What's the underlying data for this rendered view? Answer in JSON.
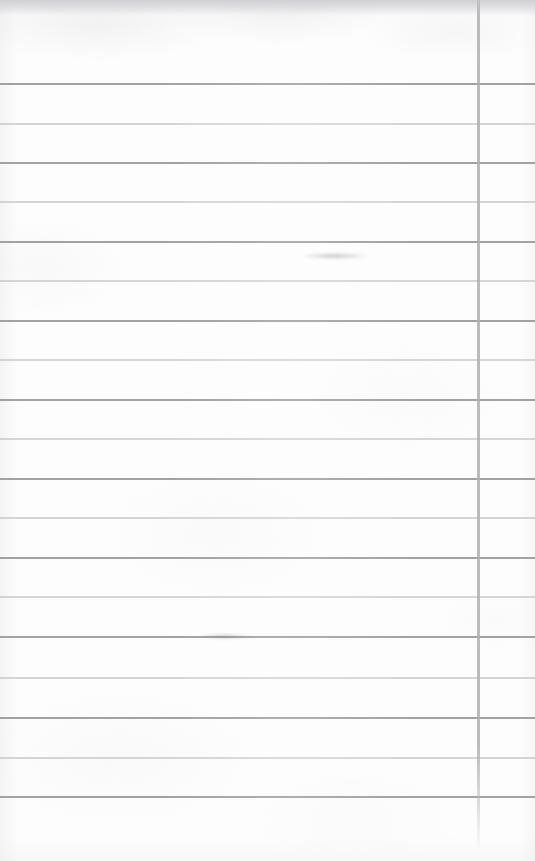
{
  "document": {
    "kind": "scanned-blank-lined-page",
    "title": "Blank ruled notebook page",
    "page_width": 535,
    "page_height": 861,
    "has_text_content": false,
    "visible_text": ""
  },
  "paper": {
    "background_color": "#fdfdfd",
    "edge_shadow_color": "#e4e4e6",
    "texture": "subtle mottled scan grain, darker band along top edge"
  },
  "ruling": {
    "horizontal_line_color_dark": "#9a9a9e",
    "horizontal_line_color_light": "#c6c6ca",
    "vertical_line_color": "#b0b0b4",
    "line_spacing_px": 39.3,
    "first_line_y": 84,
    "line_count": 19,
    "top_margin_px": 84,
    "bottom_blank_px": 64,
    "horizontal_lines": [
      {
        "y": 84,
        "thickness": 2.0,
        "tone": "dark"
      },
      {
        "y": 124,
        "thickness": 1.4,
        "tone": "light"
      },
      {
        "y": 163,
        "thickness": 1.8,
        "tone": "dark"
      },
      {
        "y": 202,
        "thickness": 1.4,
        "tone": "light"
      },
      {
        "y": 242,
        "thickness": 1.8,
        "tone": "dark"
      },
      {
        "y": 281,
        "thickness": 1.4,
        "tone": "light"
      },
      {
        "y": 321,
        "thickness": 2.0,
        "tone": "dark"
      },
      {
        "y": 360,
        "thickness": 1.3,
        "tone": "light"
      },
      {
        "y": 400,
        "thickness": 1.8,
        "tone": "dark"
      },
      {
        "y": 439,
        "thickness": 1.4,
        "tone": "light"
      },
      {
        "y": 479,
        "thickness": 2.0,
        "tone": "dark"
      },
      {
        "y": 518,
        "thickness": 1.4,
        "tone": "light"
      },
      {
        "y": 558,
        "thickness": 1.8,
        "tone": "dark"
      },
      {
        "y": 597,
        "thickness": 1.4,
        "tone": "light"
      },
      {
        "y": 637,
        "thickness": 1.9,
        "tone": "dark"
      },
      {
        "y": 678,
        "thickness": 1.4,
        "tone": "light"
      },
      {
        "y": 718,
        "thickness": 1.9,
        "tone": "dark"
      },
      {
        "y": 758,
        "thickness": 1.4,
        "tone": "light"
      },
      {
        "y": 797,
        "thickness": 1.9,
        "tone": "dark"
      }
    ],
    "vertical_lines": [
      {
        "x": 477,
        "width": 3,
        "top": 0,
        "bottom": 848,
        "tone": "margin-rule"
      }
    ]
  },
  "artifacts": [
    {
      "name": "top-edge-scan-shadow",
      "x": 0,
      "y": 0,
      "width": 535,
      "height": 16
    },
    {
      "name": "line-smudge",
      "x": 196,
      "y": 634,
      "width": 58,
      "height": 5
    },
    {
      "name": "line-smudge-faint",
      "x": 300,
      "y": 253,
      "width": 70,
      "height": 6
    }
  ]
}
